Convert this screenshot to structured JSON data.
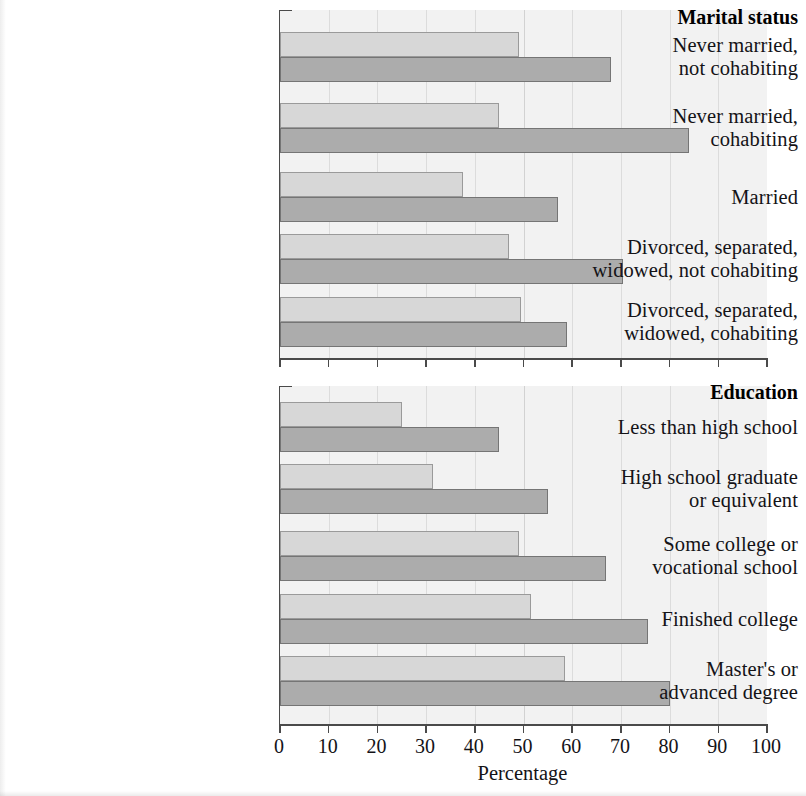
{
  "chart_data": {
    "type": "bar",
    "orientation": "horizontal",
    "title": "",
    "xlabel": "Percentage",
    "ylabel": "",
    "xlim": [
      0,
      100
    ],
    "xticks": [
      0,
      10,
      20,
      30,
      40,
      50,
      60,
      70,
      80,
      90,
      100
    ],
    "grid": true,
    "legend_position": "none",
    "series": [
      {
        "name": "light",
        "color": "#d7d7d7"
      },
      {
        "name": "dark",
        "color": "#acacac"
      }
    ],
    "panels": [
      {
        "title": "Marital status",
        "categories": [
          "Never married,\nnot cohabiting",
          "Never married,\ncohabiting",
          "Married",
          "Divorced, separated,\nwidowed, not cohabiting",
          "Divorced, separated,\nwidowed, cohabiting"
        ],
        "values": {
          "light": [
            49,
            45,
            37.5,
            47,
            49.5
          ],
          "dark": [
            68,
            84,
            57,
            70.5,
            59
          ]
        }
      },
      {
        "title": "Education",
        "categories": [
          "Less than high school",
          "High school graduate\nor equivalent",
          "Some college or\nvocational school",
          "Finished college",
          "Master's or\nadvanced degree"
        ],
        "values": {
          "light": [
            25,
            31.5,
            49,
            51.5,
            58.5
          ],
          "dark": [
            45,
            55,
            67,
            75.5,
            80
          ]
        }
      }
    ]
  },
  "marital": {
    "title": "Marital status",
    "rows": [
      {
        "line1": "Never married,",
        "line2": "not cohabiting",
        "light": 49,
        "dark": 68
      },
      {
        "line1": "Never married,",
        "line2": "cohabiting",
        "light": 45,
        "dark": 84
      },
      {
        "line1": "Married",
        "line2": "",
        "light": 37.5,
        "dark": 57
      },
      {
        "line1": "Divorced, separated,",
        "line2": "widowed, not cohabiting",
        "light": 47,
        "dark": 70.5
      },
      {
        "line1": "Divorced, separated,",
        "line2": "widowed, cohabiting",
        "light": 49.5,
        "dark": 59
      }
    ]
  },
  "education": {
    "title": "Education",
    "rows": [
      {
        "line1": "Less than high school",
        "line2": "",
        "light": 25,
        "dark": 45
      },
      {
        "line1": "High school graduate",
        "line2": "or equivalent",
        "light": 31.5,
        "dark": 55
      },
      {
        "line1": "Some college or",
        "line2": "vocational school",
        "light": 49,
        "dark": 67
      },
      {
        "line1": "Finished college",
        "line2": "",
        "light": 51.5,
        "dark": 75.5
      },
      {
        "line1": "Master's or",
        "line2": "advanced degree",
        "light": 58.5,
        "dark": 80
      }
    ]
  },
  "axis": {
    "ticks": [
      "0",
      "10",
      "20",
      "30",
      "40",
      "50",
      "60",
      "70",
      "80",
      "90",
      "100"
    ],
    "title": "Percentage"
  }
}
